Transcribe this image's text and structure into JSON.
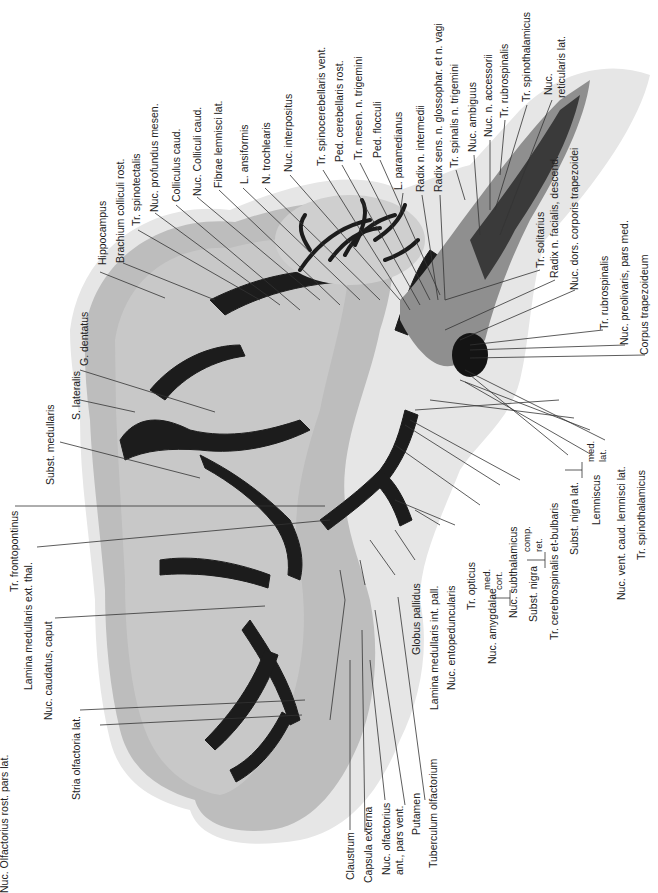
{
  "figure": {
    "type": "histological brain section, horizontal, myelin stain",
    "colors": {
      "background": "#ffffff",
      "grey_matter": "#b9b9b9",
      "light_tissue": "#d6d6d6",
      "pale_edge": "#e8e8e8",
      "white_matter": "#1c1c1c",
      "text": "#222222"
    }
  },
  "labels": {
    "top": [
      {
        "id": "hippocampus",
        "text": "Hippocampus"
      },
      {
        "id": "brachium-colliculi-rost",
        "text": "Brachium colliculi rost."
      },
      {
        "id": "tr-spinotectalis",
        "text": "Tr. spinotectalis"
      },
      {
        "id": "nuc-profundus-mesen",
        "text": "Nuc. profundus mesen."
      },
      {
        "id": "colliculus-caud",
        "text": "Colliculus caud."
      },
      {
        "id": "nuc-colliculi-caud",
        "text": "Nuc. Colliculi caud."
      },
      {
        "id": "fibrae-lemnisci-lat",
        "text": "Fibrae lemnisci lat."
      },
      {
        "id": "l-ansiformis",
        "text": "L. ansiformis"
      },
      {
        "id": "n-trochlearis",
        "text": "N. trochlearis"
      },
      {
        "id": "nuc-interpositus",
        "text": "Nuc. interpositus"
      },
      {
        "id": "tr-spinocerebellaris-vent",
        "text": "Tr. spinocerebellaris vent."
      },
      {
        "id": "ped-cerebellaris-rost",
        "text": "Ped. cerebellaris rost."
      },
      {
        "id": "tr-mesen-n-trigemini",
        "text": "Tr. mesen. n. trigemini"
      },
      {
        "id": "ped-flocculi",
        "text": "Ped. flocculi"
      },
      {
        "id": "l-paramedianus",
        "text": "L. paramedianus"
      },
      {
        "id": "radix-n-intermedii",
        "text": "Radix n. intermedii"
      },
      {
        "id": "radix-sens-glossophar-vagi",
        "text": "Radix sens. n. glossophar. et n. vagi"
      },
      {
        "id": "tr-spinalis-n-trigemini",
        "text": "Tr. spinalis n. trigemini"
      },
      {
        "id": "nuc-ambiguus",
        "text": "Nuc. ambiguus"
      },
      {
        "id": "nuc-n-accessorii",
        "text": "Nuc. n. accessorii"
      },
      {
        "id": "tr-rubrospinalis-top",
        "text": "Tr. rubrospinalis"
      },
      {
        "id": "tr-spinothalamicus-top",
        "text": "Tr. spinothalamicus"
      },
      {
        "id": "nuc-reticularis-lat-1",
        "text": "Nuc."
      },
      {
        "id": "nuc-reticularis-lat-2",
        "text": "reticularis lat."
      }
    ],
    "right": [
      {
        "id": "tr-solitarius",
        "text": "Tr. solitarius"
      },
      {
        "id": "radix-n-facialis-descend",
        "text": "Radix n. facialis, descend."
      },
      {
        "id": "nuc-dors-corporis-trapezoidei",
        "text": "Nuc. dors. corporis trapezoidei"
      },
      {
        "id": "tr-rubrospinalis-right",
        "text": "Tr. rubrospinalis"
      },
      {
        "id": "nuc-preolivaris-pars-med",
        "text": "Nuc. preolivaris, pars med."
      },
      {
        "id": "corpus-trapezoideum",
        "text": "Corpus trapezoideum"
      }
    ],
    "bottom_right": [
      {
        "id": "globus-pallidus",
        "text": "Globus pallidus"
      },
      {
        "id": "lamina-medullaris-int-pall",
        "text": "Lamina medullaris int. pall."
      },
      {
        "id": "nuc-entopeduncularis",
        "text": "Nuc. entopeduncularis"
      },
      {
        "id": "tr-opticus",
        "text": "Tr. opticus"
      },
      {
        "id": "nuc-amygdalae",
        "text": "Nuc. amygdalae"
      },
      {
        "id": "nuc-amygdalae-med",
        "text": "med."
      },
      {
        "id": "nuc-amygdalae-cort",
        "text": "cort."
      },
      {
        "id": "nuc-subthalamicus",
        "text": "Nuc. subthalamicus"
      },
      {
        "id": "subst-nigra",
        "text": "Subst. nigra"
      },
      {
        "id": "subst-nigra-comp",
        "text": "comp."
      },
      {
        "id": "subst-nigra-ret",
        "text": "ret."
      },
      {
        "id": "tr-cerebrospinalis-bulbaris",
        "text": "Tr. cerebrospinalis et-bulbaris"
      },
      {
        "id": "subst-nigra-lat",
        "text": "Subst. nigra lat."
      },
      {
        "id": "lemniscus",
        "text": "Lemniscus"
      },
      {
        "id": "lemniscus-med",
        "text": "med."
      },
      {
        "id": "lemniscus-lat",
        "text": "lat."
      },
      {
        "id": "nuc-vent-caud-lemnisci-lat",
        "text": "Nuc. vent. caud. lemnisci lat."
      },
      {
        "id": "tr-spinothalamicus-bottom",
        "text": "Tr. spinothalamicus"
      }
    ],
    "bottom": [
      {
        "id": "claustrum",
        "text": "Claustrum"
      },
      {
        "id": "capsula-externa",
        "text": "Capsula externa"
      },
      {
        "id": "nuc-olfactorius-ant-1",
        "text": "Nuc. olfactorius"
      },
      {
        "id": "nuc-olfactorius-ant-2",
        "text": "ant., pars vent."
      },
      {
        "id": "putamen",
        "text": "Putamen"
      },
      {
        "id": "tuberculum-olfactorium",
        "text": "Tuberculum olfactorium"
      }
    ],
    "left": [
      {
        "id": "s-lateralis",
        "text": "S. lateralis"
      },
      {
        "id": "g-dentatus",
        "text": "G. dentatus"
      },
      {
        "id": "subst-medullaris",
        "text": "Subst. medullaris"
      },
      {
        "id": "tr-frontopontinus",
        "text": "Tr. frontopontinus"
      },
      {
        "id": "lamina-medullaris-ext-thal",
        "text": "Lamina medullaris ext. thal."
      },
      {
        "id": "nuc-caudatus-caput",
        "text": "Nuc. caudatus, caput"
      },
      {
        "id": "stria-olfactoria-lat",
        "text": "Stria olfactoria lat."
      },
      {
        "id": "nuc-olfactorius-rost-pars-lat",
        "text": "Nuc. Olfactorius rost. pars lat."
      }
    ]
  }
}
